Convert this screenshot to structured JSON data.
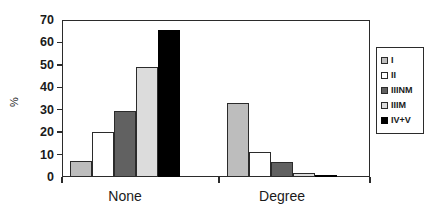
{
  "chart_data": {
    "type": "bar",
    "title": "",
    "subtitle": "",
    "xlabel": "",
    "ylabel": "%",
    "categories": [
      "None",
      "Degree"
    ],
    "ylim": [
      0,
      70
    ],
    "yticks": [
      0,
      10,
      20,
      30,
      40,
      50,
      60,
      70
    ],
    "ytick_labels": [
      "0",
      "10",
      "20",
      "30",
      "40",
      "50",
      "60",
      "70"
    ],
    "grid": false,
    "legend_position": "right-outside",
    "series": [
      {
        "name": "I",
        "values": [
          7,
          33
        ],
        "color": "#bdbdbd"
      },
      {
        "name": "II",
        "values": [
          20,
          11
        ],
        "color": "#ffffff"
      },
      {
        "name": "IIINM",
        "values": [
          29.5,
          6.5
        ],
        "color": "#616161"
      },
      {
        "name": "IIIM",
        "values": [
          49,
          2
        ],
        "color": "#dcdcdc"
      },
      {
        "name": "IV+V",
        "values": [
          65.5,
          1
        ],
        "color": "#000000"
      }
    ]
  },
  "legend": {
    "entries": [
      {
        "label": "I"
      },
      {
        "label": "II"
      },
      {
        "label": "IIINM"
      },
      {
        "label": "IIIM"
      },
      {
        "label": "IV+V"
      }
    ]
  },
  "axis": {
    "y_title": "%",
    "x_labels": [
      "None",
      "Degree"
    ]
  }
}
